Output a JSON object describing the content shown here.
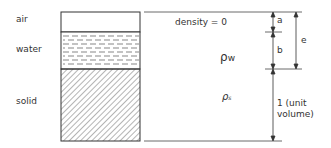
{
  "layers": [
    {
      "name": "air",
      "label": "air",
      "density_label": "density = 0",
      "dim": "a"
    },
    {
      "name": "water",
      "label": "water",
      "density_label": "ρw",
      "dim": "b"
    },
    {
      "name": "solid",
      "label": "solid",
      "density_label": "ρs",
      "dim": "1 (unit volume)"
    }
  ],
  "labels": {
    "air": "air",
    "water": "water",
    "solid": "solid",
    "density_air": "density = 0",
    "rho_w": "ρ",
    "rho_w_sub": "w",
    "rho_s": "ρ",
    "rho_s_sub": "s",
    "dim_a": "a",
    "dim_b": "b",
    "dim_e": "e",
    "dim_unit_line1": "1 (unit",
    "dim_unit_line2": "volume)"
  },
  "colors": {
    "line": "#333333",
    "background": "#ffffff"
  }
}
